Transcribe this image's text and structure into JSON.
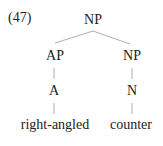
{
  "example_number": "(47)",
  "tree": {
    "root": "NP",
    "left": {
      "phrase": "AP",
      "head": "A",
      "word": "right-angled"
    },
    "right": {
      "phrase": "NP",
      "head": "N",
      "word": "counter"
    }
  },
  "colors": {
    "text": "#222222",
    "lines": "#999999"
  }
}
